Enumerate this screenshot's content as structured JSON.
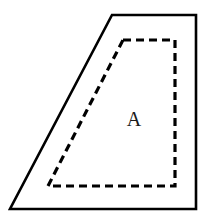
{
  "figure": {
    "canvas": {
      "width": 210,
      "height": 222,
      "background_color": "#ffffff"
    },
    "outer_shape": {
      "name": "outer-trapezoid",
      "stroke_style": "solid",
      "stroke_color": "#000000",
      "stroke_width": 2.6,
      "fill_color": "#ffffff",
      "points": "112,15 196,15 196,209 10,209",
      "vertices": [
        {
          "label": "top-left",
          "x": 112,
          "y": 15
        },
        {
          "label": "top-right",
          "x": 196,
          "y": 15
        },
        {
          "label": "bottom-right",
          "x": 196,
          "y": 209
        },
        {
          "label": "bottom-left",
          "x": 10,
          "y": 209
        }
      ]
    },
    "inner_shape": {
      "name": "inner-dashed-trapezoid",
      "stroke_style": "dashed",
      "stroke_color": "#000000",
      "stroke_width": 3.2,
      "dash_array": "8 5",
      "fill_color": "none",
      "points": "123,40 175,40 175,186 48,186",
      "vertices": [
        {
          "label": "top-left",
          "x": 123,
          "y": 40
        },
        {
          "label": "top-right",
          "x": 175,
          "y": 40
        },
        {
          "label": "bottom-right",
          "x": 175,
          "y": 186
        },
        {
          "label": "bottom-left",
          "x": 48,
          "y": 186
        }
      ]
    },
    "labels": [
      {
        "name": "region-label-a",
        "text": "A",
        "x": 134,
        "y": 126,
        "font_size": 20,
        "color": "#1a1a1a"
      }
    ]
  }
}
